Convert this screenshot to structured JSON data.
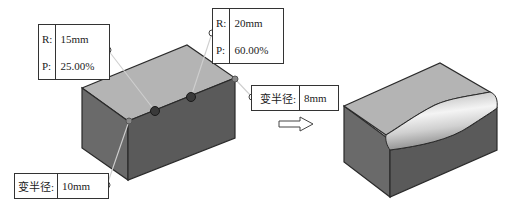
{
  "figure": {
    "before_label": "Cube with variable radius fillet control points",
    "after_label": "Cube with variable radius fillet applied"
  },
  "callouts": {
    "point1": {
      "r_label": "R:",
      "r_value": "15mm",
      "p_label": "P:",
      "p_value": "25.00%"
    },
    "point2": {
      "r_label": "R:",
      "r_value": "20mm",
      "p_label": "P:",
      "p_value": "60.00%"
    },
    "end_right": {
      "label": "变半径:",
      "value": "8mm"
    },
    "end_left": {
      "label": "变半径:",
      "value": "10mm"
    }
  },
  "arrow": {
    "icon": "hollow-right-arrow"
  },
  "colors": {
    "top_face": "#b4b4b4",
    "front_face": "#5a5a5a",
    "side_face": "#6e6e6e",
    "edge": "#2a2a2a",
    "fillet_highlight": "#f2f2f2"
  }
}
